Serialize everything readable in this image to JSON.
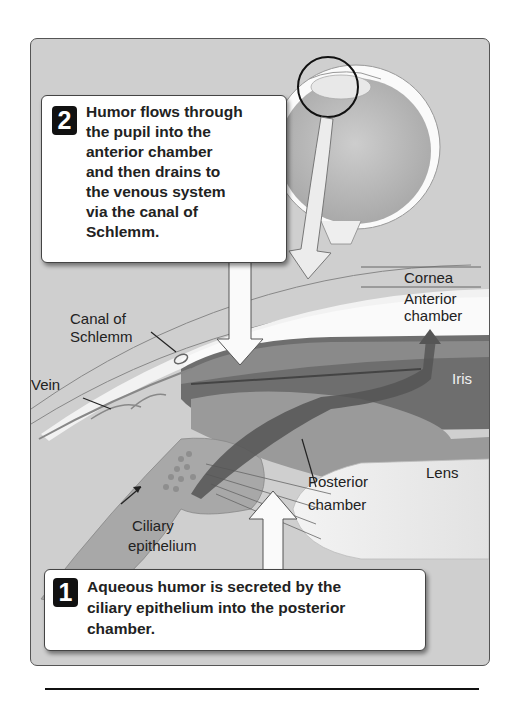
{
  "figure": {
    "callouts": [
      {
        "step": "2",
        "lines": [
          "Humor flows through",
          "the pupil into the",
          "anterior chamber",
          "and then drains to",
          "the venous system",
          "via the canal of",
          "Schlemm."
        ]
      },
      {
        "step": "1",
        "lines": [
          "Aqueous humor is secreted by the",
          "ciliary epithelium into the posterior",
          "chamber."
        ]
      }
    ],
    "labels": {
      "cornea": "Cornea",
      "anterior_chamber_1": "Anterior",
      "anterior_chamber_2": "chamber",
      "canal_1": "Canal of",
      "canal_2": "Schlemm",
      "vein": "Vein",
      "iris": "Iris",
      "lens": "Lens",
      "posterior_1": "Posterior",
      "posterior_2": "chamber",
      "ciliary_1": "Ciliary",
      "ciliary_2": "epithelium"
    },
    "colors": {
      "panel_bg": "#cfcfcf",
      "iris": "#6e6e6e",
      "badge": "#111111"
    }
  }
}
